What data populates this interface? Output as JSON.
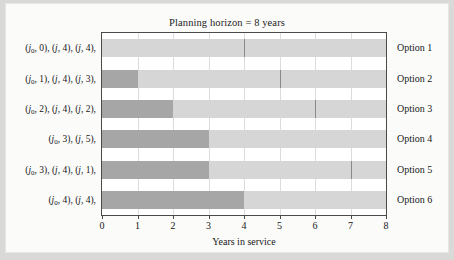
{
  "chart_data": {
    "type": "bar",
    "title": "Planning horizon = 8 years",
    "xlabel": "Years in service",
    "ylabel": "",
    "xlim": [
      0,
      8
    ],
    "xticks": [
      "0",
      "1",
      "2",
      "3",
      "4",
      "5",
      "6",
      "7",
      "8"
    ],
    "grid": true,
    "legend": "none",
    "orientation": "horizontal",
    "colors": {
      "dark_segment": "#a6a6a6",
      "light_segment": "#d6d6d6",
      "divider": "#8a8a8a",
      "frame": "#4a4a4a",
      "gridline": "#dcdcdc",
      "figure_background": "#fbfbfa",
      "page_background": "#d9d9d7",
      "text": "#181818"
    },
    "categories": [
      "Option 1",
      "Option 2",
      "Option 3",
      "Option 4",
      "Option 5",
      "Option 6"
    ],
    "rows": [
      {
        "option": "Option 1",
        "policy": "(j0, 0), (j, 4), (j, 4),",
        "policy_parts": [
          {
            "sym": "j",
            "sub": "0",
            "num": "0"
          },
          {
            "sym": "j",
            "sub": "",
            "num": "4"
          },
          {
            "sym": "j",
            "sub": "",
            "num": "4"
          }
        ],
        "segments": [
          {
            "start": 0,
            "end": 4,
            "shade": "light"
          },
          {
            "start": 4,
            "end": 8,
            "shade": "light"
          }
        ],
        "dividers": [
          4
        ]
      },
      {
        "option": "Option 2",
        "policy": "(j0, 1), (j, 4), (j, 3),",
        "policy_parts": [
          {
            "sym": "j",
            "sub": "0",
            "num": "1"
          },
          {
            "sym": "j",
            "sub": "",
            "num": "4"
          },
          {
            "sym": "j",
            "sub": "",
            "num": "3"
          }
        ],
        "segments": [
          {
            "start": 0,
            "end": 1,
            "shade": "dark"
          },
          {
            "start": 1,
            "end": 5,
            "shade": "light"
          },
          {
            "start": 5,
            "end": 8,
            "shade": "light"
          }
        ],
        "dividers": [
          5
        ]
      },
      {
        "option": "Option 3",
        "policy": "(j0, 2), (j, 4), (j, 2),",
        "policy_parts": [
          {
            "sym": "j",
            "sub": "0",
            "num": "2"
          },
          {
            "sym": "j",
            "sub": "",
            "num": "4"
          },
          {
            "sym": "j",
            "sub": "",
            "num": "2"
          }
        ],
        "segments": [
          {
            "start": 0,
            "end": 2,
            "shade": "dark"
          },
          {
            "start": 2,
            "end": 6,
            "shade": "light"
          },
          {
            "start": 6,
            "end": 8,
            "shade": "light"
          }
        ],
        "dividers": [
          6
        ]
      },
      {
        "option": "Option 4",
        "policy": "(j0, 3), (j, 5),",
        "policy_parts": [
          {
            "sym": "j",
            "sub": "0",
            "num": "3"
          },
          {
            "sym": "j",
            "sub": "",
            "num": "5"
          }
        ],
        "segments": [
          {
            "start": 0,
            "end": 3,
            "shade": "dark"
          },
          {
            "start": 3,
            "end": 8,
            "shade": "light"
          }
        ],
        "dividers": []
      },
      {
        "option": "Option 5",
        "policy": "(j0, 3), (j, 4), (j, 1),",
        "policy_parts": [
          {
            "sym": "j",
            "sub": "0",
            "num": "3"
          },
          {
            "sym": "j",
            "sub": "",
            "num": "4"
          },
          {
            "sym": "j",
            "sub": "",
            "num": "1"
          }
        ],
        "segments": [
          {
            "start": 0,
            "end": 3,
            "shade": "dark"
          },
          {
            "start": 3,
            "end": 7,
            "shade": "light"
          },
          {
            "start": 7,
            "end": 8,
            "shade": "light"
          }
        ],
        "dividers": [
          7
        ]
      },
      {
        "option": "Option 6",
        "policy": "(j0, 4), (j, 4),",
        "policy_parts": [
          {
            "sym": "j",
            "sub": "0",
            "num": "4"
          },
          {
            "sym": "j",
            "sub": "",
            "num": "4"
          }
        ],
        "segments": [
          {
            "start": 0,
            "end": 4,
            "shade": "dark"
          },
          {
            "start": 4,
            "end": 8,
            "shade": "light"
          }
        ],
        "dividers": []
      }
    ]
  }
}
